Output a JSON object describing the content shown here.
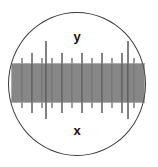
{
  "view": {
    "title": "microscope-eyepiece-reticle",
    "width": 158,
    "height": 167,
    "background_color": "#ffffff"
  },
  "field_of_view": {
    "shape": "circle",
    "center_x": 77,
    "center_y": 84,
    "radius_x": 69,
    "radius_y": 72,
    "stroke_color": "#3a3a3a",
    "stroke_width": 1.3,
    "fill": "none"
  },
  "labels": {
    "y_axis": "y",
    "x_axis": "x",
    "color": "#111111",
    "font_size": 13,
    "font_weight": "bold"
  },
  "scale": {
    "orientation": "horizontal",
    "tick_color": "#555555",
    "tick_color_major": "#2b2b2b",
    "band_left": 12,
    "band_right": 145,
    "spacing": 2.05,
    "minor": {
      "top": 63,
      "bottom": 103,
      "width": 1.0,
      "color": "#5a5a5a"
    },
    "medium": {
      "top": 58,
      "bottom": 108,
      "width": 1.1,
      "color": "#4a4a4a",
      "every": 5
    },
    "major": {
      "top": 53,
      "bottom": 113,
      "width": 1.2,
      "color": "#333333",
      "every": 10
    },
    "tall": {
      "top": 41,
      "bottom": 119,
      "width": 1.2,
      "color": "#2b2b2b",
      "positions": [
        46,
        128
      ]
    },
    "tick_count": 65
  },
  "chart_data": {
    "type": "scatter",
    "xlabel": "x",
    "ylabel": "y",
    "orientation": "horizontal",
    "x": [
      12,
      14,
      16,
      18,
      20,
      22,
      24,
      26,
      28,
      30,
      32,
      34,
      36,
      38,
      40,
      42,
      44,
      46,
      48,
      50,
      52,
      54,
      56,
      58,
      60,
      62,
      64,
      66,
      68,
      70,
      72,
      74,
      76,
      78,
      80,
      82,
      84,
      86,
      88,
      90,
      92,
      94,
      96,
      98,
      100,
      102,
      104,
      106,
      108,
      110,
      112,
      114,
      116,
      118,
      120,
      122,
      124,
      126,
      128,
      130,
      132,
      134,
      136,
      138,
      140,
      142,
      144
    ],
    "values": [
      1,
      1,
      1,
      1,
      1,
      2,
      1,
      1,
      1,
      1,
      3,
      1,
      1,
      1,
      1,
      2,
      1,
      4,
      1,
      1,
      2,
      1,
      1,
      1,
      1,
      3,
      1,
      1,
      1,
      1,
      2,
      1,
      1,
      1,
      1,
      3,
      1,
      1,
      1,
      1,
      2,
      1,
      1,
      1,
      1,
      3,
      1,
      1,
      1,
      1,
      2,
      1,
      1,
      1,
      1,
      3,
      1,
      1,
      4,
      1,
      1,
      2,
      1,
      1,
      1,
      1,
      1
    ],
    "legend": [
      "minor tick",
      "medium tick",
      "major tick",
      "tall tick"
    ],
    "grid": false,
    "axis_range_x": [
      12,
      145
    ]
  }
}
